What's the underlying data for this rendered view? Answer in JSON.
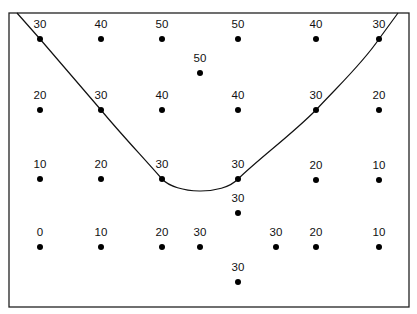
{
  "diagram": {
    "type": "contour-sketch",
    "frame": {
      "x": 9,
      "y": 13,
      "width": 400,
      "height": 294
    },
    "colors": {
      "line": "#111111",
      "dot": "#000000",
      "frame": "#222222",
      "background": "#ffffff"
    },
    "points": [
      {
        "x": 40,
        "y": 39,
        "value": "30"
      },
      {
        "x": 101,
        "y": 39,
        "value": "40"
      },
      {
        "x": 162,
        "y": 39,
        "value": "50"
      },
      {
        "x": 238,
        "y": 39,
        "value": "50"
      },
      {
        "x": 316,
        "y": 39,
        "value": "40"
      },
      {
        "x": 379,
        "y": 39,
        "value": "30"
      },
      {
        "x": 200,
        "y": 73,
        "value": "50"
      },
      {
        "x": 40,
        "y": 110,
        "value": "20"
      },
      {
        "x": 101,
        "y": 110,
        "value": "30"
      },
      {
        "x": 162,
        "y": 110,
        "value": "40"
      },
      {
        "x": 238,
        "y": 110,
        "value": "40"
      },
      {
        "x": 316,
        "y": 110,
        "value": "30"
      },
      {
        "x": 379,
        "y": 110,
        "value": "20"
      },
      {
        "x": 40,
        "y": 179,
        "value": "10"
      },
      {
        "x": 101,
        "y": 179,
        "value": "20"
      },
      {
        "x": 162,
        "y": 179,
        "value": "30"
      },
      {
        "x": 238,
        "y": 179,
        "value": "30"
      },
      {
        "x": 316,
        "y": 180,
        "value": "20"
      },
      {
        "x": 379,
        "y": 180,
        "value": "10"
      },
      {
        "x": 238,
        "y": 213,
        "value": "30"
      },
      {
        "x": 40,
        "y": 247,
        "value": "0"
      },
      {
        "x": 101,
        "y": 247,
        "value": "10"
      },
      {
        "x": 162,
        "y": 247,
        "value": "20"
      },
      {
        "x": 200,
        "y": 247,
        "value": "30"
      },
      {
        "x": 276,
        "y": 247,
        "value": "30"
      },
      {
        "x": 316,
        "y": 247,
        "value": "20"
      },
      {
        "x": 379,
        "y": 247,
        "value": "10"
      },
      {
        "x": 238,
        "y": 282,
        "value": "30"
      }
    ],
    "contour": {
      "value": "30",
      "path": "M 17 13 L 40 39 L 101 110 C 120 133 140 154 162 179 C 176 194 222 196 238 179 C 262 156 290 136 316 110 C 340 84 362 64 379 39 L 398 13"
    }
  }
}
